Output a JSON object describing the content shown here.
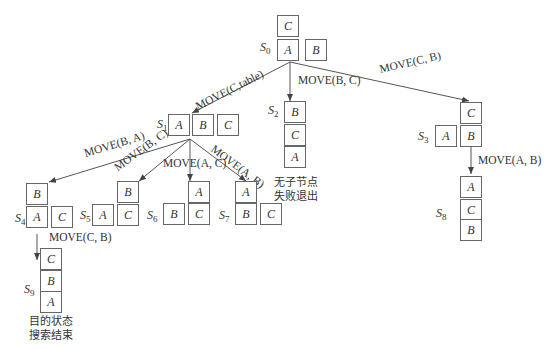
{
  "diagram": {
    "type": "state-space search tree",
    "states": {
      "S0": {
        "label": "S",
        "sub": "0",
        "stacks": [
          [
            "A",
            "C"
          ],
          [
            "B"
          ]
        ]
      },
      "S1": {
        "label": "S",
        "sub": "1",
        "stacks": [
          [
            "A"
          ],
          [
            "B"
          ],
          [
            "C"
          ]
        ]
      },
      "S2": {
        "label": "S",
        "sub": "2",
        "stacks": [
          [
            "A",
            "C",
            "B"
          ]
        ]
      },
      "S3": {
        "label": "S",
        "sub": "3",
        "stacks": [
          [
            "A"
          ],
          [
            "B",
            "C"
          ]
        ]
      },
      "S4": {
        "label": "S",
        "sub": "4",
        "stacks": [
          [
            "A",
            "B"
          ],
          [
            "C"
          ]
        ]
      },
      "S5": {
        "label": "S",
        "sub": "5",
        "stacks": [
          [
            "A"
          ],
          [
            "C",
            "B"
          ]
        ]
      },
      "S6": {
        "label": "S",
        "sub": "6",
        "stacks": [
          [
            "B"
          ],
          [
            "C",
            "A"
          ]
        ]
      },
      "S7": {
        "label": "S",
        "sub": "7",
        "stacks": [
          [
            "B",
            "A"
          ],
          [
            "C"
          ]
        ]
      },
      "S8": {
        "label": "S",
        "sub": "8",
        "stacks": [
          [
            "B",
            "C",
            "A"
          ]
        ]
      },
      "S9": {
        "label": "S",
        "sub": "9",
        "stacks": [
          [
            "A",
            "B",
            "C"
          ]
        ]
      }
    },
    "edges": [
      {
        "from": "S0",
        "to": "S1",
        "label": "MOVE(C,table)"
      },
      {
        "from": "S0",
        "to": "S2",
        "label": "MOVE(B, C)"
      },
      {
        "from": "S0",
        "to": "S3",
        "label": "MOVE(C, B)"
      },
      {
        "from": "S1",
        "to": "S4",
        "label": "MOVE(B, A)"
      },
      {
        "from": "S1",
        "to": "S5",
        "label": "MOVE(B, C)"
      },
      {
        "from": "S1",
        "to": "S6",
        "label": "MOVE(A, C)"
      },
      {
        "from": "S1",
        "to": "S7",
        "label": "MOVE(A, B)"
      },
      {
        "from": "S3",
        "to": "S8",
        "label": "MOVE(A, C)"
      },
      {
        "from": "S4",
        "to": "S9",
        "label": "MOVE(C, B)"
      }
    ],
    "notes": {
      "s2_line1": "无子节点",
      "s2_line2": "失败退出",
      "s9_line1": "目的状态",
      "s9_line2": "搜索结束"
    }
  }
}
